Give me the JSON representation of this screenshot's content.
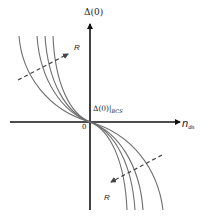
{
  "diagram": {
    "y_axis_label": "Δ(0)",
    "x_axis_label_main": "n",
    "x_axis_label_sub": "dis",
    "origin_label": "0",
    "bcs_label_main": "Δ(0)|",
    "bcs_label_sub": "BCS",
    "arrow_top_label": "R",
    "arrow_bottom_label": "R",
    "curve_count": 4,
    "colors": {
      "axis": "#111111",
      "curve": "#6e6e6e",
      "dashed_arrow": "#555555"
    }
  }
}
